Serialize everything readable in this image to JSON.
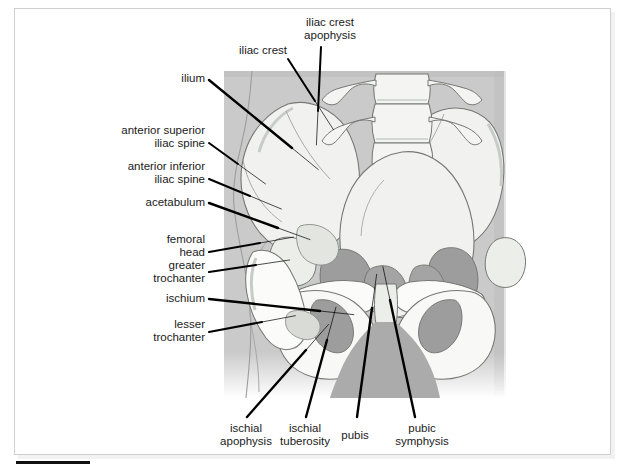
{
  "figure": {
    "kind": "anatomical-illustration",
    "view": "anteroposterior",
    "colors": {
      "soft_tissue": "#b2b2b2",
      "bone_light": "#f1f2f0",
      "bone_shade": "#d9dbd7",
      "outline": "#6e706c",
      "leader": "#000000",
      "text": "#1a1a1a",
      "frame": "#cfcfcf",
      "rule": "#111111"
    }
  },
  "labels": [
    {
      "id": "iliac-crest",
      "text": "iliac crest",
      "lines": [
        "iliac crest"
      ],
      "align": "right",
      "x": 287,
      "y": 44,
      "width": 0,
      "leader": {
        "x1": 288,
        "y1": 59,
        "x2": 315,
        "y2": 101
      }
    },
    {
      "id": "iliac-crest-apophysis",
      "text": "iliac crest apophysis",
      "lines": [
        "iliac crest",
        "apophysis"
      ],
      "align": "center",
      "x": 330,
      "y": 16,
      "width": 0,
      "leader": {
        "x1": 321,
        "y1": 47,
        "x2": 318,
        "y2": 111
      }
    },
    {
      "id": "ilium",
      "text": "ilium",
      "lines": [
        "ilium"
      ],
      "align": "right",
      "x": 205,
      "y": 72,
      "width": 0,
      "leader": {
        "x1": 209,
        "y1": 80,
        "x2": 292,
        "y2": 148
      }
    },
    {
      "id": "anterior-superior-iliac-spine",
      "text": "anterior superior iliac spine",
      "lines": [
        "anterior superior",
        "iliac spine"
      ],
      "align": "right",
      "x": 205,
      "y": 124,
      "width": 0,
      "leader": {
        "x1": 209,
        "y1": 143,
        "x2": 238,
        "y2": 164
      }
    },
    {
      "id": "anterior-inferior-iliac-spine",
      "text": "anterior inferior iliac spine",
      "lines": [
        "anterior inferior",
        "iliac spine"
      ],
      "align": "right",
      "x": 205,
      "y": 160,
      "width": 0,
      "leader": {
        "x1": 209,
        "y1": 179,
        "x2": 250,
        "y2": 196
      }
    },
    {
      "id": "acetabulum",
      "text": "acetabulum",
      "lines": [
        "acetabulum"
      ],
      "align": "right",
      "x": 205,
      "y": 196,
      "width": 0,
      "leader": {
        "x1": 209,
        "y1": 203,
        "x2": 278,
        "y2": 228
      }
    },
    {
      "id": "femoral-head",
      "text": "femoral head",
      "lines": [
        "femoral",
        "head"
      ],
      "align": "right",
      "x": 205,
      "y": 233,
      "width": 0,
      "leader": {
        "x1": 209,
        "y1": 252,
        "x2": 260,
        "y2": 243
      }
    },
    {
      "id": "greater-trochanter",
      "text": "greater trochanter",
      "lines": [
        "greater",
        "trochanter"
      ],
      "align": "right",
      "x": 205,
      "y": 259,
      "width": 0,
      "leader": {
        "x1": 209,
        "y1": 272,
        "x2": 256,
        "y2": 265
      }
    },
    {
      "id": "ischium",
      "text": "ischium",
      "lines": [
        "ischium"
      ],
      "align": "right",
      "x": 205,
      "y": 292,
      "width": 0,
      "leader": {
        "x1": 209,
        "y1": 299,
        "x2": 320,
        "y2": 311
      }
    },
    {
      "id": "lesser-trochanter",
      "text": "lesser trochanter",
      "lines": [
        "lesser",
        "trochanter"
      ],
      "align": "right",
      "x": 205,
      "y": 318,
      "width": 0,
      "leader": {
        "x1": 209,
        "y1": 332,
        "x2": 262,
        "y2": 322
      }
    },
    {
      "id": "ischial-apophysis",
      "text": "ischial apophysis",
      "lines": [
        "ischial",
        "apophysis"
      ],
      "align": "center",
      "x": 246,
      "y": 422,
      "width": 0,
      "leader": {
        "x1": 247,
        "y1": 417,
        "x2": 306,
        "y2": 350
      }
    },
    {
      "id": "ischial-tuberosity",
      "text": "ischial tuberosity",
      "lines": [
        "ischial",
        "tuberosity"
      ],
      "align": "center",
      "x": 305,
      "y": 422,
      "width": 0,
      "leader": {
        "x1": 306,
        "y1": 417,
        "x2": 327,
        "y2": 340
      }
    },
    {
      "id": "pubis",
      "text": "pubis",
      "lines": [
        "pubis"
      ],
      "align": "center",
      "x": 355,
      "y": 429,
      "width": 0,
      "leader": {
        "x1": 357,
        "y1": 417,
        "x2": 372,
        "y2": 308
      }
    },
    {
      "id": "pubic-symphysis",
      "text": "pubic symphysis",
      "lines": [
        "pubic",
        "symphysis"
      ],
      "align": "center",
      "x": 422,
      "y": 422,
      "width": 0,
      "leader": {
        "x1": 415,
        "y1": 417,
        "x2": 390,
        "y2": 300
      }
    }
  ]
}
